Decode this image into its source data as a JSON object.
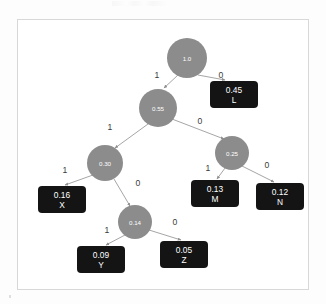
{
  "diagram": {
    "type": "binary-decision-tree",
    "title": "",
    "colors": {
      "node_fill": "#8c8c8c",
      "node_text": "#ffffff",
      "leaf_fill": "#141414",
      "leaf_text": "#ffffff",
      "edge_stroke": "#9b9b9b",
      "edge_label_text": "#3a3a3a",
      "frame_border": "#d8d8d8",
      "canvas_background": "#ffffff"
    },
    "nodes": [
      {
        "id": "root",
        "label": "1.0",
        "kind": "internal",
        "cx": 169,
        "cy": 38,
        "r": 20
      },
      {
        "id": "n055",
        "label": "0.55",
        "kind": "internal",
        "cx": 140,
        "cy": 88,
        "r": 19
      },
      {
        "id": "n025",
        "label": "0.25",
        "kind": "internal",
        "cx": 214,
        "cy": 133,
        "r": 17
      },
      {
        "id": "n030",
        "label": "0.30",
        "kind": "internal",
        "cx": 87,
        "cy": 143,
        "r": 18
      },
      {
        "id": "n014",
        "label": "0.14",
        "kind": "internal",
        "cx": 117,
        "cy": 202,
        "r": 17
      }
    ],
    "leaves": [
      {
        "id": "L",
        "value": "0.45",
        "name": "L",
        "x": 192,
        "y": 61,
        "w": 48,
        "h": 27
      },
      {
        "id": "X",
        "value": "0.16",
        "name": "X",
        "x": 20,
        "y": 166,
        "w": 48,
        "h": 27
      },
      {
        "id": "M",
        "value": "0.13",
        "name": "M",
        "x": 173,
        "y": 160,
        "w": 48,
        "h": 27
      },
      {
        "id": "N",
        "value": "0.12",
        "name": "N",
        "x": 238,
        "y": 163,
        "w": 48,
        "h": 27
      },
      {
        "id": "Y",
        "value": "0.09",
        "name": "Y",
        "x": 59,
        "y": 226,
        "w": 48,
        "h": 27
      },
      {
        "id": "Z",
        "value": "0.05",
        "name": "Z",
        "x": 142,
        "y": 221,
        "w": 48,
        "h": 27
      }
    ],
    "edges": [
      {
        "from": "root",
        "to": "n055",
        "label": "1",
        "x1": 160,
        "y1": 55,
        "x2": 146,
        "y2": 68,
        "lx": 139,
        "ly": 55
      },
      {
        "from": "root",
        "to": "L",
        "label": "0",
        "x1": 180,
        "y1": 55,
        "x2": 207,
        "y2": 60,
        "lx": 203,
        "ly": 55
      },
      {
        "from": "n055",
        "to": "n030",
        "label": "1",
        "x1": 130,
        "y1": 104,
        "x2": 97,
        "y2": 128,
        "lx": 92,
        "ly": 107
      },
      {
        "from": "n055",
        "to": "n025",
        "label": "0",
        "x1": 154,
        "y1": 99,
        "x2": 206,
        "y2": 119,
        "lx": 182,
        "ly": 101
      },
      {
        "from": "n030",
        "to": "X",
        "label": "1",
        "x1": 75,
        "y1": 155,
        "x2": 47,
        "y2": 165,
        "lx": 47,
        "ly": 150
      },
      {
        "from": "n030",
        "to": "n014",
        "label": "0",
        "x1": 96,
        "y1": 159,
        "x2": 112,
        "y2": 186,
        "lx": 120,
        "ly": 163
      },
      {
        "from": "n025",
        "to": "M",
        "label": "1",
        "x1": 207,
        "y1": 148,
        "x2": 199,
        "y2": 159,
        "lx": 190,
        "ly": 148
      },
      {
        "from": "n025",
        "to": "N",
        "label": "0",
        "x1": 224,
        "y1": 146,
        "x2": 256,
        "y2": 162,
        "lx": 249,
        "ly": 145
      },
      {
        "from": "n014",
        "to": "Y",
        "label": "1",
        "x1": 107,
        "y1": 215,
        "x2": 88,
        "y2": 225,
        "lx": 89,
        "ly": 210
      },
      {
        "from": "n014",
        "to": "Z",
        "label": "0",
        "x1": 131,
        "y1": 210,
        "x2": 163,
        "y2": 220,
        "lx": 157,
        "ly": 202
      }
    ]
  }
}
